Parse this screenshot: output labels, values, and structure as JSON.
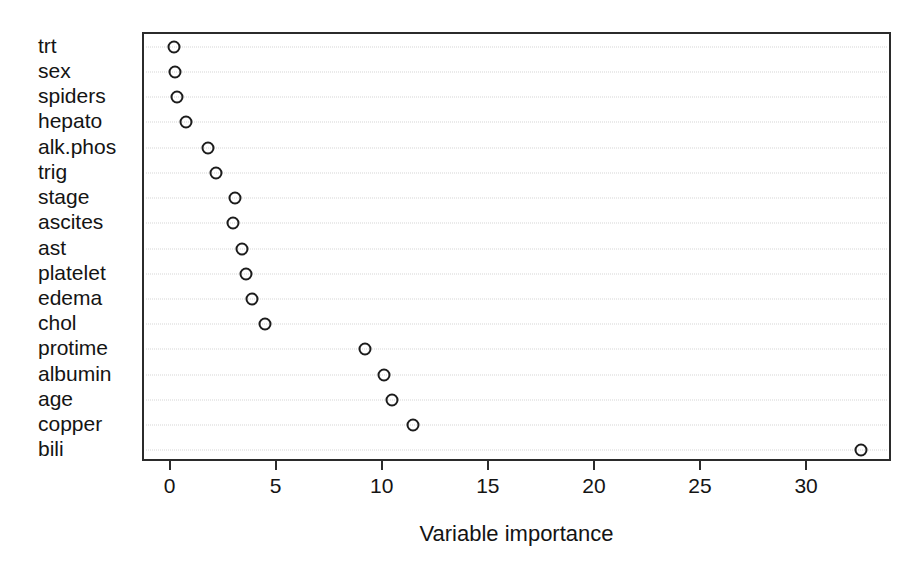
{
  "chart_data": {
    "type": "scatter",
    "title": "",
    "subtitle": "",
    "xlabel": "Variable importance",
    "ylabel": "",
    "xlim": [
      -1.3,
      34.0
    ],
    "xticks": [
      0,
      5,
      10,
      15,
      20,
      25,
      30
    ],
    "xticklabels": [
      "0",
      "5",
      "10",
      "15",
      "20",
      "25",
      "30"
    ],
    "grid": "horizontal-dotted",
    "legend": "none",
    "categories": [
      "trt",
      "sex",
      "spiders",
      "hepato",
      "alk.phos",
      "trig",
      "stage",
      "ascites",
      "ast",
      "platelet",
      "edema",
      "chol",
      "protime",
      "albumin",
      "age",
      "copper",
      "bili"
    ],
    "values": [
      0.1,
      0.15,
      0.25,
      0.7,
      1.7,
      2.1,
      3.0,
      2.9,
      3.3,
      3.5,
      3.8,
      4.4,
      9.1,
      10.0,
      10.4,
      11.4,
      32.5
    ],
    "marker": "open-circle",
    "marker_color": "#1c1c1c",
    "grid_color": "#d6d6d6",
    "frame_color": "#2b2b2b",
    "background_color": "#ffffff"
  }
}
